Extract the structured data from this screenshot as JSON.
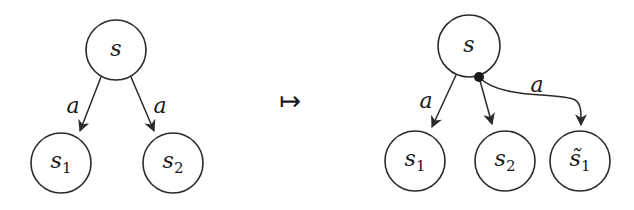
{
  "left_diagram": {
    "root": {
      "label": "s"
    },
    "children": [
      {
        "label": "s",
        "subscript": "1",
        "edge_label": "a"
      },
      {
        "label": "s",
        "subscript": "2",
        "edge_label": "a"
      }
    ]
  },
  "mapsto_symbol": "↦",
  "right_diagram": {
    "root": {
      "label": "s"
    },
    "branch_point": "filled-dot",
    "children": [
      {
        "label": "s",
        "subscript": "1",
        "edge_label": "a"
      },
      {
        "label": "s",
        "subscript": "2",
        "edge_label": ""
      },
      {
        "label": "s̃",
        "subscript": "1",
        "edge_label": "a"
      }
    ]
  }
}
